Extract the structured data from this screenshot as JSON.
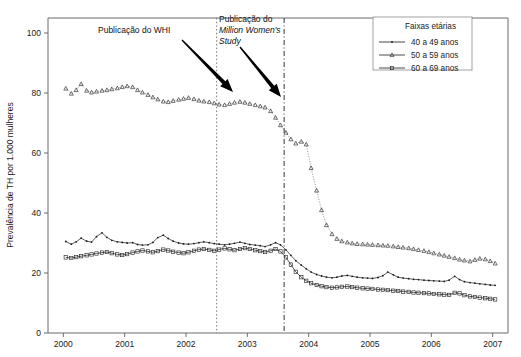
{
  "chart_data": {
    "type": "line",
    "title": "",
    "xlabel": "",
    "ylabel": "Prevalência de TH por 1.000 mulheres",
    "xlim": [
      1999.75,
      2007.25
    ],
    "ylim": [
      0,
      105
    ],
    "yticks": [
      0,
      20,
      40,
      60,
      80,
      100
    ],
    "xticks": [
      2000,
      2001,
      2002,
      2003,
      2004,
      2005,
      2006,
      2007
    ],
    "grid": false,
    "legend_position": "top-right",
    "legend_title": "Faixas etárias",
    "series": [
      {
        "name": "40 a 49 anos",
        "marker": "dot",
        "x": [
          2000.04,
          2000.13,
          2000.21,
          2000.29,
          2000.38,
          2000.46,
          2000.54,
          2000.63,
          2000.71,
          2000.79,
          2000.88,
          2000.96,
          2001.04,
          2001.13,
          2001.21,
          2001.29,
          2001.38,
          2001.46,
          2001.54,
          2001.63,
          2001.71,
          2001.79,
          2001.88,
          2001.96,
          2002.04,
          2002.13,
          2002.21,
          2002.29,
          2002.38,
          2002.46,
          2002.54,
          2002.63,
          2002.71,
          2002.79,
          2002.88,
          2002.96,
          2003.04,
          2003.13,
          2003.21,
          2003.29,
          2003.38,
          2003.46,
          2003.54,
          2003.63,
          2003.71,
          2003.79,
          2003.88,
          2003.96,
          2004.04,
          2004.13,
          2004.21,
          2004.29,
          2004.38,
          2004.46,
          2004.54,
          2004.63,
          2004.71,
          2004.79,
          2004.88,
          2004.96,
          2005.04,
          2005.13,
          2005.21,
          2005.29,
          2005.38,
          2005.46,
          2005.54,
          2005.63,
          2005.71,
          2005.79,
          2005.88,
          2005.96,
          2006.04,
          2006.13,
          2006.21,
          2006.29,
          2006.38,
          2006.46,
          2006.54,
          2006.63,
          2006.71,
          2006.79,
          2006.88,
          2006.96,
          2007.04
        ],
        "y": [
          30.5,
          29.6,
          30.4,
          31.6,
          30.6,
          30.3,
          32.1,
          33.4,
          31.9,
          30.9,
          30.4,
          30.2,
          30.0,
          30.1,
          29.5,
          29.3,
          29.4,
          30.2,
          31.8,
          32.6,
          31.5,
          30.6,
          30.0,
          29.7,
          29.6,
          29.8,
          30.1,
          30.4,
          30.1,
          29.8,
          29.6,
          29.4,
          29.6,
          29.9,
          30.3,
          29.9,
          29.5,
          29.3,
          29.1,
          28.8,
          29.4,
          30.1,
          29.4,
          27.7,
          25.9,
          24.1,
          22.6,
          21.4,
          20.3,
          19.5,
          19.0,
          18.6,
          18.4,
          18.6,
          19.0,
          19.2,
          18.9,
          18.6,
          18.4,
          18.3,
          18.2,
          18.5,
          19.1,
          20.3,
          19.4,
          18.6,
          18.3,
          18.1,
          17.9,
          17.8,
          17.6,
          17.5,
          17.4,
          17.3,
          17.2,
          17.6,
          18.9,
          17.8,
          17.1,
          16.8,
          16.6,
          16.4,
          16.2,
          16.0,
          15.9
        ]
      },
      {
        "name": "50 a 59 anos",
        "marker": "triangle",
        "x": [
          2000.04,
          2000.13,
          2000.21,
          2000.29,
          2000.38,
          2000.46,
          2000.54,
          2000.63,
          2000.71,
          2000.79,
          2000.88,
          2000.96,
          2001.04,
          2001.13,
          2001.21,
          2001.29,
          2001.38,
          2001.46,
          2001.54,
          2001.63,
          2001.71,
          2001.79,
          2001.88,
          2001.96,
          2002.04,
          2002.13,
          2002.21,
          2002.29,
          2002.38,
          2002.46,
          2002.54,
          2002.63,
          2002.71,
          2002.79,
          2002.88,
          2002.96,
          2003.04,
          2003.13,
          2003.21,
          2003.29,
          2003.38,
          2003.46,
          2003.54,
          2003.63,
          2003.71,
          2003.79,
          2003.88,
          2003.96,
          2004.04,
          2004.13,
          2004.21,
          2004.29,
          2004.38,
          2004.46,
          2004.54,
          2004.63,
          2004.71,
          2004.79,
          2004.88,
          2004.96,
          2005.04,
          2005.13,
          2005.21,
          2005.29,
          2005.38,
          2005.46,
          2005.54,
          2005.63,
          2005.71,
          2005.79,
          2005.88,
          2005.96,
          2006.04,
          2006.13,
          2006.21,
          2006.29,
          2006.38,
          2006.46,
          2006.54,
          2006.63,
          2006.71,
          2006.79,
          2006.88,
          2006.96,
          2007.04
        ],
        "y": [
          81.5,
          79.8,
          81.0,
          83.0,
          80.8,
          80.2,
          80.5,
          80.8,
          81.0,
          81.3,
          81.6,
          82.0,
          82.3,
          82.0,
          81.0,
          80.2,
          79.4,
          78.6,
          77.9,
          77.2,
          77.0,
          77.4,
          77.8,
          78.1,
          78.4,
          78.0,
          77.5,
          77.2,
          77.0,
          76.6,
          76.2,
          76.0,
          76.4,
          76.8,
          77.1,
          76.8,
          76.4,
          76.0,
          75.6,
          75.2,
          74.0,
          71.8,
          69.3,
          66.8,
          64.6,
          63.2,
          63.8,
          62.9,
          55.0,
          47.5,
          41.0,
          36.0,
          33.0,
          31.4,
          30.6,
          30.2,
          29.9,
          29.7,
          29.6,
          29.5,
          29.4,
          29.3,
          29.2,
          29.1,
          28.9,
          28.7,
          28.5,
          28.3,
          28.0,
          27.7,
          27.4,
          27.0,
          26.6,
          26.2,
          25.8,
          25.4,
          25.0,
          24.5,
          24.2,
          23.9,
          24.4,
          24.8,
          24.6,
          24.0,
          23.2
        ]
      },
      {
        "name": "60 a 69 anos",
        "marker": "square",
        "x": [
          2000.04,
          2000.13,
          2000.21,
          2000.29,
          2000.38,
          2000.46,
          2000.54,
          2000.63,
          2000.71,
          2000.79,
          2000.88,
          2000.96,
          2001.04,
          2001.13,
          2001.21,
          2001.29,
          2001.38,
          2001.46,
          2001.54,
          2001.63,
          2001.71,
          2001.79,
          2001.88,
          2001.96,
          2002.04,
          2002.13,
          2002.21,
          2002.29,
          2002.38,
          2002.46,
          2002.54,
          2002.63,
          2002.71,
          2002.79,
          2002.88,
          2002.96,
          2003.04,
          2003.13,
          2003.21,
          2003.29,
          2003.38,
          2003.46,
          2003.54,
          2003.63,
          2003.71,
          2003.79,
          2003.88,
          2003.96,
          2004.04,
          2004.13,
          2004.21,
          2004.29,
          2004.38,
          2004.46,
          2004.54,
          2004.63,
          2004.71,
          2004.79,
          2004.88,
          2004.96,
          2005.04,
          2005.13,
          2005.21,
          2005.29,
          2005.38,
          2005.46,
          2005.54,
          2005.63,
          2005.71,
          2005.79,
          2005.88,
          2005.96,
          2006.04,
          2006.13,
          2006.21,
          2006.29,
          2006.38,
          2006.46,
          2006.54,
          2006.63,
          2006.71,
          2006.79,
          2006.88,
          2006.96,
          2007.04
        ],
        "y": [
          25.2,
          25.0,
          25.3,
          25.6,
          25.9,
          26.2,
          26.5,
          26.8,
          27.0,
          26.6,
          26.2,
          26.0,
          26.3,
          26.8,
          27.2,
          27.5,
          27.2,
          26.9,
          27.3,
          27.8,
          27.5,
          27.1,
          26.8,
          26.6,
          26.9,
          27.4,
          27.8,
          28.0,
          27.7,
          27.4,
          27.8,
          28.2,
          27.9,
          27.6,
          28.0,
          28.3,
          28.0,
          27.6,
          27.3,
          27.0,
          27.4,
          28.0,
          27.2,
          25.2,
          22.8,
          20.4,
          18.6,
          17.4,
          16.6,
          16.0,
          15.6,
          15.3,
          15.1,
          15.2,
          15.4,
          15.5,
          15.3,
          15.1,
          14.9,
          14.8,
          14.7,
          14.5,
          14.4,
          14.3,
          14.1,
          14.0,
          13.8,
          13.7,
          13.5,
          13.4,
          13.3,
          13.2,
          13.0,
          12.9,
          12.8,
          12.7,
          13.4,
          13.2,
          12.6,
          12.2,
          12.0,
          11.8,
          11.6,
          11.4,
          11.2
        ]
      }
    ],
    "annotations": [
      {
        "id": "whi",
        "lines": [
          "Publicação do WHI"
        ],
        "italic_lines": [],
        "text_x": 98,
        "text_y": 33,
        "vline_x_value": 2002.5,
        "vline_style": "dotted",
        "arrow_from": [
          182,
          40
        ],
        "arrow_to": [
          233,
          92
        ]
      },
      {
        "id": "mws",
        "lines": [
          "Publicação do"
        ],
        "italic_lines": [
          "Million Women's",
          "Study"
        ],
        "text_x": 219,
        "text_y": 22,
        "vline_x_value": 2003.6,
        "vline_style": "dashdot",
        "arrow_from": [
          240,
          47
        ],
        "arrow_to": [
          281,
          97
        ]
      }
    ]
  },
  "figure": {
    "background_color": "#ffffff",
    "axis_color": "#6b6b6b",
    "series_color": "#1a1a1a"
  }
}
